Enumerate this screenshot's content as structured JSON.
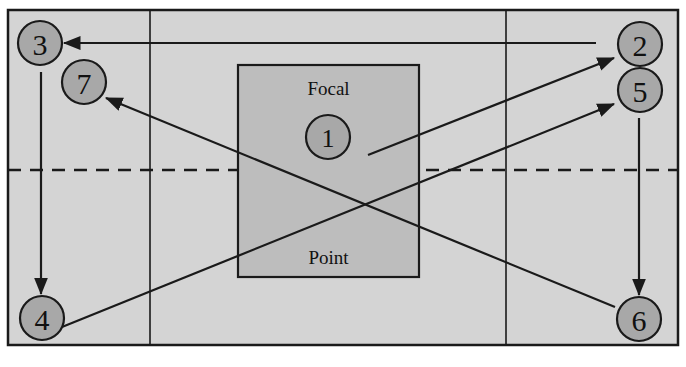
{
  "diagram": {
    "canvas": {
      "width": 686,
      "height": 367,
      "background": "#ffffff"
    },
    "colors": {
      "field_fill": "#d4d4d4",
      "field_border": "#1a1a1a",
      "box_fill": "#bdbdbd",
      "box_border": "#1a1a1a",
      "node_fill": "#a8a8a8",
      "node_border": "#1a1a1a",
      "line": "#1a1a1a",
      "text": "#111111"
    },
    "field": {
      "name": "outer-field",
      "x": 8,
      "y": 10,
      "width": 670,
      "height": 335,
      "vertical_gridlines": [
        150,
        506
      ],
      "dashed_midline_y": 170
    },
    "focal_box": {
      "label_top": "Focal",
      "label_bottom": "Point",
      "x": 238,
      "y": 65,
      "width": 181,
      "height": 212
    },
    "nodes": [
      {
        "id": "1",
        "label": "1",
        "cx": 328,
        "cy": 137,
        "r": 22
      },
      {
        "id": "2",
        "label": "2",
        "cx": 640,
        "cy": 44,
        "r": 22
      },
      {
        "id": "3",
        "label": "3",
        "cx": 40,
        "cy": 43,
        "r": 22
      },
      {
        "id": "4",
        "label": "4",
        "cx": 42,
        "cy": 318,
        "r": 22
      },
      {
        "id": "5",
        "label": "5",
        "cx": 640,
        "cy": 90,
        "r": 22
      },
      {
        "id": "6",
        "label": "6",
        "cx": 639,
        "cy": 319,
        "r": 22
      },
      {
        "id": "7",
        "label": "7",
        "cx": 84,
        "cy": 82,
        "r": 22
      }
    ],
    "arrows": [
      {
        "name": "arrow-1-to-2",
        "from": "1",
        "to": "2",
        "x1": 368,
        "y1": 155,
        "x2": 614,
        "y2": 58
      },
      {
        "name": "arrow-2-to-3",
        "from": "2",
        "to": "3",
        "x1": 596,
        "y1": 43,
        "x2": 64,
        "y2": 43
      },
      {
        "name": "arrow-3-to-4",
        "from": "3",
        "to": "4",
        "x1": 41,
        "y1": 72,
        "x2": 41,
        "y2": 294
      },
      {
        "name": "arrow-4-to-5",
        "from": "4",
        "to": "5",
        "x1": 62,
        "y1": 327,
        "x2": 614,
        "y2": 104
      },
      {
        "name": "arrow-5-to-6",
        "from": "5",
        "to": "6",
        "x1": 639,
        "y1": 118,
        "x2": 639,
        "y2": 295
      },
      {
        "name": "arrow-6-to-7",
        "from": "6",
        "to": "7",
        "x1": 615,
        "y1": 307,
        "x2": 106,
        "y2": 98
      }
    ]
  }
}
